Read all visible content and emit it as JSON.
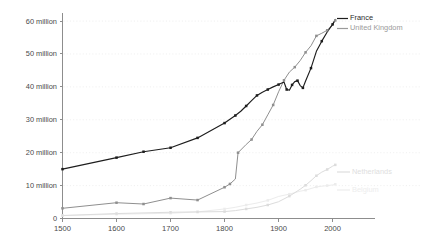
{
  "chart_data": {
    "type": "line",
    "title": "",
    "subtitle": "",
    "xlabel": "",
    "ylabel": "",
    "xlim": [
      1500,
      2010
    ],
    "ylim": [
      0,
      62
    ],
    "grid": "horizontal-dotted",
    "legend_position": "top-right and right-inline",
    "value_unit": "millions of people",
    "y_ticks": [
      0,
      10,
      20,
      30,
      40,
      50,
      60
    ],
    "y_tick_labels": [
      "0",
      "10 million",
      "20 million",
      "30 million",
      "40 million",
      "50 million",
      "60 million"
    ],
    "x_ticks": [
      1500,
      1600,
      1700,
      1800,
      1900,
      2000
    ],
    "x_tick_labels": [
      "1500",
      "1600",
      "1700",
      "1800",
      "1900",
      "2000"
    ],
    "series": [
      {
        "name": "France",
        "color": "#1d1d1d",
        "markers": true,
        "label_position": "legend-top-right",
        "points": [
          [
            1500,
            15.0
          ],
          [
            1600,
            18.5
          ],
          [
            1650,
            20.3
          ],
          [
            1700,
            21.5
          ],
          [
            1750,
            24.5
          ],
          [
            1800,
            29.0
          ],
          [
            1820,
            31.3
          ],
          [
            1830,
            32.6
          ],
          [
            1840,
            34.2
          ],
          [
            1850,
            35.8
          ],
          [
            1860,
            37.4
          ],
          [
            1870,
            38.4
          ],
          [
            1880,
            39.2
          ],
          [
            1890,
            40.0
          ],
          [
            1900,
            40.7
          ],
          [
            1910,
            41.5
          ],
          [
            1915,
            39.2
          ],
          [
            1920,
            39.0
          ],
          [
            1925,
            40.6
          ],
          [
            1930,
            41.6
          ],
          [
            1935,
            41.9
          ],
          [
            1940,
            40.4
          ],
          [
            1945,
            39.7
          ],
          [
            1950,
            41.8
          ],
          [
            1960,
            45.7
          ],
          [
            1970,
            50.8
          ],
          [
            1980,
            53.9
          ],
          [
            1990,
            56.7
          ],
          [
            2000,
            59.0
          ],
          [
            2005,
            60.5
          ]
        ]
      },
      {
        "name": "United Kingdom",
        "color": "#8f8f8f",
        "markers": true,
        "label_position": "legend-top-right",
        "points": [
          [
            1500,
            3.1
          ],
          [
            1600,
            4.8
          ],
          [
            1650,
            4.4
          ],
          [
            1700,
            6.2
          ],
          [
            1750,
            5.6
          ],
          [
            1800,
            9.5
          ],
          [
            1810,
            10.5
          ],
          [
            1820,
            12.0
          ],
          [
            1825,
            20.0
          ],
          [
            1840,
            22.5
          ],
          [
            1850,
            24.0
          ],
          [
            1860,
            26.5
          ],
          [
            1870,
            28.5
          ],
          [
            1880,
            31.5
          ],
          [
            1890,
            34.5
          ],
          [
            1900,
            38.5
          ],
          [
            1910,
            42.0
          ],
          [
            1920,
            44.5
          ],
          [
            1930,
            46.0
          ],
          [
            1940,
            48.0
          ],
          [
            1950,
            50.5
          ],
          [
            1960,
            52.5
          ],
          [
            1970,
            55.5
          ],
          [
            1980,
            56.3
          ],
          [
            1990,
            57.2
          ],
          [
            2000,
            58.8
          ],
          [
            2005,
            60.2
          ]
        ]
      },
      {
        "name": "Netherlands",
        "color": "#dcdcdc",
        "markers": true,
        "label_position": "right-inline",
        "points": [
          [
            1500,
            0.9
          ],
          [
            1600,
            1.5
          ],
          [
            1700,
            1.9
          ],
          [
            1750,
            2.0
          ],
          [
            1800,
            2.1
          ],
          [
            1820,
            2.4
          ],
          [
            1840,
            2.9
          ],
          [
            1860,
            3.4
          ],
          [
            1880,
            4.1
          ],
          [
            1900,
            5.1
          ],
          [
            1920,
            6.8
          ],
          [
            1940,
            8.9
          ],
          [
            1950,
            10.1
          ],
          [
            1960,
            11.5
          ],
          [
            1970,
            13.0
          ],
          [
            1980,
            14.1
          ],
          [
            1990,
            14.9
          ],
          [
            2000,
            15.9
          ],
          [
            2005,
            16.3
          ]
        ]
      },
      {
        "name": "Belgium",
        "color": "#ececec",
        "markers": true,
        "label_position": "right-inline",
        "points": [
          [
            1500,
            0.9
          ],
          [
            1600,
            1.3
          ],
          [
            1700,
            1.6
          ],
          [
            1750,
            2.0
          ],
          [
            1800,
            2.9
          ],
          [
            1820,
            3.4
          ],
          [
            1840,
            4.1
          ],
          [
            1860,
            4.7
          ],
          [
            1880,
            5.5
          ],
          [
            1900,
            6.7
          ],
          [
            1920,
            7.4
          ],
          [
            1940,
            8.3
          ],
          [
            1950,
            8.6
          ],
          [
            1960,
            9.1
          ],
          [
            1970,
            9.6
          ],
          [
            1980,
            9.8
          ],
          [
            1990,
            10.0
          ],
          [
            2000,
            10.2
          ],
          [
            2005,
            10.4
          ]
        ]
      }
    ]
  },
  "legend": {
    "items": [
      {
        "label": "France",
        "color": "#1d1d1d"
      },
      {
        "label": "United Kingdom",
        "color": "#9a9a9a"
      }
    ]
  },
  "inline_labels": [
    {
      "label": "Netherlands",
      "color": "#dedede"
    },
    {
      "label": "Belgium",
      "color": "#ededed"
    }
  ]
}
